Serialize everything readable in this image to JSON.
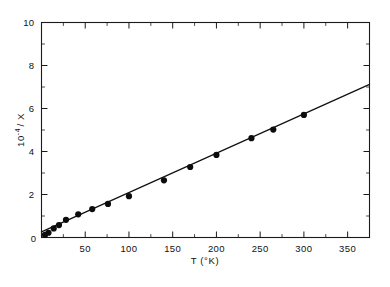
{
  "chart_data": {
    "type": "scatter",
    "title": "",
    "subtitle": "",
    "xlabel": "T  (°K)",
    "ylabel": "10⁻⁴ / X",
    "ylabel_parts": {
      "base": "10",
      "exponent": "-4",
      "tail": "/ X"
    },
    "xlim": [
      0,
      375
    ],
    "ylim": [
      0,
      10
    ],
    "xticks": [
      0,
      50,
      100,
      150,
      200,
      250,
      300,
      350
    ],
    "xtick_labels": [
      "0",
      "50",
      "100",
      "150",
      "200",
      "250",
      "300",
      "350"
    ],
    "xticks_minor": [
      25,
      75,
      125,
      175,
      225,
      275,
      325,
      375
    ],
    "yticks": [
      0,
      2,
      4,
      6,
      8,
      10
    ],
    "ytick_labels": [
      "0",
      "2",
      "4",
      "6",
      "8",
      "10"
    ],
    "yticks_minor": [
      1,
      3,
      5,
      7,
      9
    ],
    "grid": false,
    "legend": null,
    "tick_direction": "in",
    "frame": "box",
    "series": [
      {
        "name": "inverse susceptibility data",
        "marker": "filled-circle",
        "marker_color": "#0c0c0c",
        "marker_size": 3.1,
        "x": [
          4,
          8,
          14,
          20,
          28,
          42,
          58,
          76,
          100,
          140,
          170,
          200,
          240,
          265,
          300
        ],
        "y": [
          0.12,
          0.22,
          0.42,
          0.58,
          0.82,
          1.08,
          1.32,
          1.56,
          1.92,
          2.66,
          3.28,
          3.84,
          4.62,
          5.02,
          5.7
        ]
      },
      {
        "name": "linear fit",
        "type": "line",
        "line_color": "#111111",
        "x": [
          0,
          375
        ],
        "y": [
          0.26,
          7.12
        ]
      }
    ]
  },
  "figure": {
    "background_color": "#ffffff",
    "axis_color": "#1a1a1a",
    "accent_color": "#0c0c0c"
  }
}
